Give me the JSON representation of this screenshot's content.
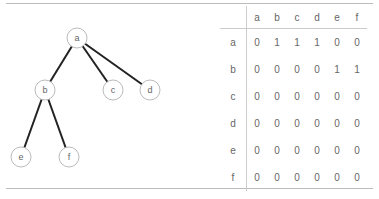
{
  "tree": {
    "nodes": [
      {
        "id": "a",
        "label": "a",
        "x": 77,
        "y": 38
      },
      {
        "id": "b",
        "label": "b",
        "x": 45,
        "y": 90
      },
      {
        "id": "c",
        "label": "c",
        "x": 113,
        "y": 90
      },
      {
        "id": "d",
        "label": "d",
        "x": 150,
        "y": 90
      },
      {
        "id": "e",
        "label": "e",
        "x": 21,
        "y": 157
      },
      {
        "id": "f",
        "label": "f",
        "x": 69,
        "y": 157
      }
    ],
    "edges": [
      [
        "a",
        "b"
      ],
      [
        "a",
        "c"
      ],
      [
        "a",
        "d"
      ],
      [
        "b",
        "e"
      ],
      [
        "b",
        "f"
      ]
    ]
  },
  "matrix": {
    "columns": [
      "a",
      "b",
      "c",
      "d",
      "e",
      "f"
    ],
    "rows": [
      {
        "label": "a",
        "values": [
          "0",
          "1",
          "1",
          "1",
          "0",
          "0"
        ]
      },
      {
        "label": "b",
        "values": [
          "0",
          "0",
          "0",
          "0",
          "1",
          "1"
        ]
      },
      {
        "label": "c",
        "values": [
          "0",
          "0",
          "0",
          "0",
          "0",
          "0"
        ]
      },
      {
        "label": "d",
        "values": [
          "0",
          "0",
          "0",
          "0",
          "0",
          "0"
        ]
      },
      {
        "label": "e",
        "values": [
          "0",
          "0",
          "0",
          "0",
          "0",
          "0"
        ]
      },
      {
        "label": "f",
        "values": [
          "0",
          "0",
          "0",
          "0",
          "0",
          "0"
        ]
      }
    ]
  }
}
